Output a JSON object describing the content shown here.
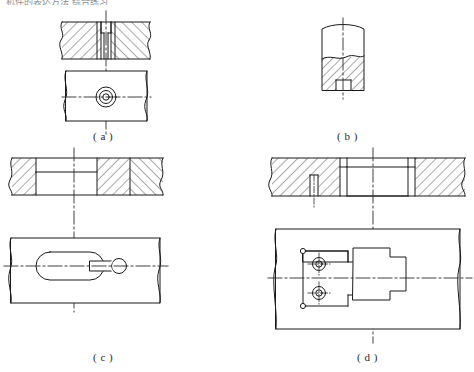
{
  "sheet": {
    "title_partial": "机件的表达方法  综合练习",
    "background_color": "#ffffff",
    "line_color": "#1a1a1a",
    "hatch_color": "#2b2b2b",
    "centerline_color": "#2b2b2b"
  },
  "figures": [
    {
      "key": "a",
      "label": "( a )",
      "description": "Counterbored through hole in a plate: full section above, plan view below",
      "views": [
        {
          "type": "section",
          "name": "full-section-view"
        },
        {
          "type": "plan",
          "name": "top-view"
        }
      ],
      "features": [
        "counterbore",
        "through-hole",
        "hatching-left",
        "hatching-right",
        "break-lines"
      ]
    },
    {
      "key": "b",
      "label": "( b )",
      "description": "Partial local section of a cylindrical boss with a small blind hole at the bottom",
      "views": [
        {
          "type": "local-section",
          "name": "local-section-view"
        }
      ],
      "features": [
        "local-section",
        "blind-hole",
        "hatching",
        "break-line"
      ]
    },
    {
      "key": "c",
      "label": "( c )",
      "description": "Obround slot with keyhole end: half section above, plan view below",
      "views": [
        {
          "type": "section",
          "name": "half-section-view"
        },
        {
          "type": "plan",
          "name": "top-view"
        }
      ],
      "features": [
        "obround-slot",
        "keyhole-end",
        "half-section",
        "hatching-right",
        "break-lines"
      ]
    },
    {
      "key": "d",
      "label": "( d )",
      "description": "Stepped recess pocket with two tapped holes: full section above, plan view below",
      "views": [
        {
          "type": "section",
          "name": "full-section-view"
        },
        {
          "type": "plan",
          "name": "top-view"
        }
      ],
      "features": [
        "stepped-pocket",
        "two-tapped-holes",
        "crosshair-symbols",
        "hatching",
        "break-lines"
      ]
    }
  ]
}
